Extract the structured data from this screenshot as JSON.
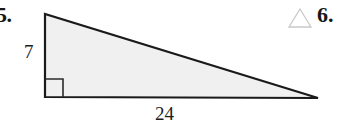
{
  "figure": {
    "type": "right-triangle",
    "fill_color": "#f0f0f0",
    "stroke_color": "#1a1a1a",
    "right_angle_marker": true,
    "vertices": {
      "top_left": [
        45,
        14
      ],
      "bottom_left": [
        45,
        97
      ],
      "bottom_right": [
        318,
        98
      ]
    },
    "labels": {
      "vertical_leg": "7",
      "horizontal_leg": "24"
    }
  },
  "problems": {
    "left_number": "5.",
    "right_number": "6."
  },
  "icons": {
    "triangle_outline": "triangle-outline-icon",
    "triangle_outline_color": "#c9c9c9"
  }
}
